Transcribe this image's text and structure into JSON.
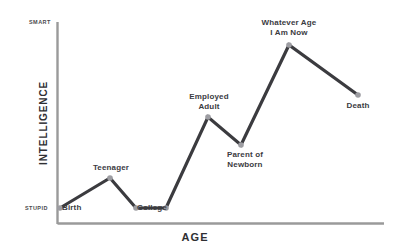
{
  "chart_data": {
    "type": "line",
    "title": "",
    "xlabel": "AGE",
    "ylabel": "INTELLIGENCE",
    "y_axis_top_label": "SMART",
    "y_axis_bottom_label": "STUPID",
    "grid": false,
    "legend": "none",
    "categories": [
      "Birth",
      "Teenager",
      "College",
      "College",
      "Employed Adult",
      "Parent of Newborn",
      "Whatever Age I Am Now",
      "Death"
    ],
    "x": [
      60,
      110,
      136,
      166,
      208,
      241,
      289,
      358
    ],
    "values": [
      8,
      26,
      8,
      8,
      61,
      45,
      101,
      73
    ],
    "ylim": [
      0,
      115
    ],
    "xlim": [
      57,
      384
    ],
    "points": [
      {
        "label": "Birth",
        "px": 60,
        "py": 208,
        "label_pos": "below-right"
      },
      {
        "label": "Teenager",
        "px": 110,
        "py": 178,
        "label_pos": "above"
      },
      {
        "label": "College",
        "px": 136,
        "py": 208,
        "label_pos": "below"
      },
      {
        "label": "",
        "px": 166,
        "py": 208,
        "label_pos": "none"
      },
      {
        "label": "Employed\nAdult",
        "px": 208,
        "py": 117,
        "label_pos": "above"
      },
      {
        "label": "Parent of\nNewborn",
        "px": 241,
        "py": 145,
        "label_pos": "below-right"
      },
      {
        "label": "Whatever Age\nI Am Now",
        "px": 289,
        "py": 45,
        "label_pos": "above"
      },
      {
        "label": "Death",
        "px": 358,
        "py": 95,
        "label_pos": "below"
      }
    ],
    "annotations": [
      "Birth",
      "Teenager",
      "College",
      "Employed Adult",
      "Parent of Newborn",
      "Whatever Age I Am Now",
      "Death"
    ]
  },
  "labels": {
    "birth": "Birth",
    "teenager": "Teenager",
    "college": "College",
    "employed_adult": "Employed\nAdult",
    "parent_of_newborn": "Parent of\nNewborn",
    "whatever_age": "Whatever Age\nI Am Now",
    "death": "Death"
  },
  "axes": {
    "y_title": "INTELLIGENCE",
    "x_title": "AGE",
    "y_top": "SMART",
    "y_bottom": "STUPID"
  },
  "colors": {
    "line": "#3b3b3f",
    "marker": "#9d9da2",
    "axis": "#9a9a9a",
    "text": "#2f2f33",
    "background": "#ffffff"
  }
}
